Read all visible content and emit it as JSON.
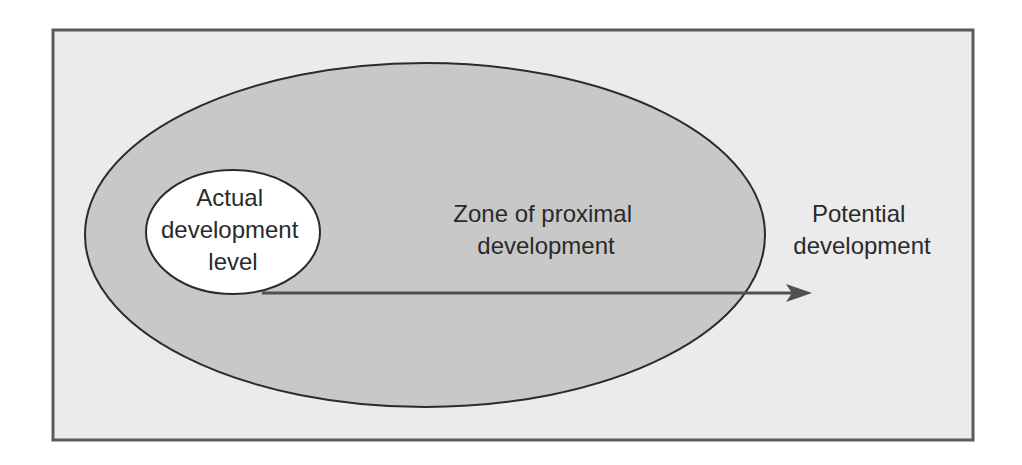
{
  "diagram": {
    "colors": {
      "background": "#ffffff",
      "frame_fill": "#ebebeb",
      "frame_stroke": "#5a5a5a",
      "outer_fill": "#c8c8c8",
      "inner_fill": "#ffffff",
      "stroke": "#2b2b2b",
      "arrow": "#505050"
    },
    "inner_region": {
      "lines": [
        "Actual",
        "development",
        "level"
      ]
    },
    "outer_region": {
      "lines": [
        "Zone of proximal",
        "development"
      ]
    },
    "outside_region": {
      "lines": [
        "Potential",
        "development"
      ]
    },
    "arrow": {
      "from": "Actual development level",
      "to": "Potential development"
    }
  }
}
